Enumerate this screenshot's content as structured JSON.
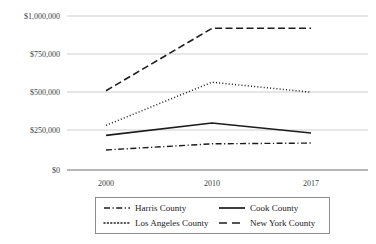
{
  "chart_data": {
    "type": "line",
    "title": "",
    "xlabel": "",
    "ylabel": "",
    "x": [
      "2000",
      "2010",
      "2017"
    ],
    "categories": [
      "2000",
      "2010",
      "2017"
    ],
    "ylim": [
      0,
      1000000
    ],
    "yticks": [
      0,
      250000,
      500000,
      750000,
      1000000
    ],
    "ytick_labels": [
      "$0",
      "$250,000",
      "$500,000",
      "$750,000",
      "$1,000,000"
    ],
    "xtick_labels": [
      "2000",
      "2010",
      "2017"
    ],
    "grid": true,
    "legend_position": "bottom",
    "series": [
      {
        "name": "Harris County",
        "style": "dash-dot",
        "color": "#1c1c1c",
        "values": [
          130000,
          170000,
          175000
        ]
      },
      {
        "name": "Cook County",
        "style": "solid",
        "color": "#1c1c1c",
        "values": [
          225000,
          305000,
          240000
        ]
      },
      {
        "name": "Los Angeles County",
        "style": "dotted",
        "color": "#1c1c1c",
        "values": [
          290000,
          570000,
          505000
        ]
      },
      {
        "name": "New York County",
        "style": "dashed",
        "color": "#1c1c1c",
        "values": [
          515000,
          920000,
          920000
        ]
      }
    ]
  },
  "legend": {
    "entries": [
      {
        "label": "Harris County",
        "style": "dash-dot"
      },
      {
        "label": "Cook County",
        "style": "solid"
      },
      {
        "label": "Los Angeles County",
        "style": "dotted"
      },
      {
        "label": "New York County",
        "style": "dashed"
      }
    ]
  },
  "axes": {
    "y_tick_labels": [
      "$1,000,000",
      "$750,000",
      "$500,000",
      "$250,000",
      "$0"
    ],
    "x_tick_labels": [
      "2000",
      "2010",
      "2017"
    ]
  }
}
